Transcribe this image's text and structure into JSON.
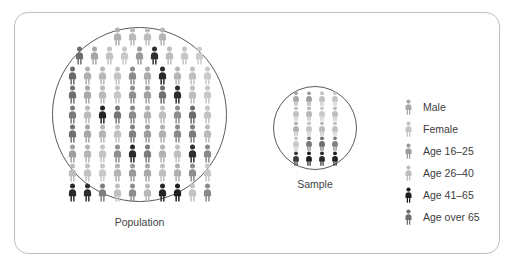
{
  "figure": {
    "type": "pictogram-diagram",
    "frame_border_color": "#bfbfbf",
    "circle_stroke_color": "#5a5a5a",
    "background_color": "#ffffff"
  },
  "population": {
    "caption": "Population",
    "icon_name": "person-icon",
    "columns_max": 10,
    "rows": 9,
    "total_icons": 84,
    "shades": [
      [
        "#b0b0b0",
        "#b8b8b8",
        "#bdbdbd",
        "#b4b4b4"
      ],
      [
        "#6e6e6e",
        "#a5a5a5",
        "#c2c2c2",
        "#c8c8c8",
        "#9a9a9a",
        "#2f2f2f",
        "#bcbcbc",
        "#c6c6c6",
        "#cdcdcd"
      ],
      [
        "#6a6a6a",
        "#b0b0b0",
        "#b8b8b8",
        "#c4c4c4",
        "#8c8c8c",
        "#adadad",
        "#2a2a2a",
        "#b6b6b6",
        "#c0c0c0",
        "#cacaca"
      ],
      [
        "#6f6f6f",
        "#a8a8a8",
        "#bababa",
        "#c6c6c6",
        "#8f8f8f",
        "#a2a2a2",
        "#707070",
        "#2d2d2d",
        "#bdbdbd",
        "#c7c7c7"
      ],
      [
        "#7a7a7a",
        "#bcbcbc",
        "#262626",
        "#767676",
        "#8a8a8a",
        "#b2b2b2",
        "#bebebe",
        "#8e8e8e",
        "#6b6b6b",
        "#c4c4c4"
      ],
      [
        "#707070",
        "#a6a6a6",
        "#b4b4b4",
        "#c2c2c2",
        "#7f7f7f",
        "#9c9c9c",
        "#b0b0b0",
        "#8a8a8a",
        "#7d7d7d",
        "#bababa"
      ],
      [
        "#9e9e9e",
        "#b6b6b6",
        "#c4c4c4",
        "#8e8e8e",
        "#2b2b2b",
        "#7c7c7c",
        "#b2b2b2",
        "#c0c0c0",
        "#2e2e2e",
        "#8a8a8a"
      ],
      [
        "#bcbcbc",
        "#c2c2c2",
        "#c8c8c8",
        "#b4b4b4",
        "#9a9a9a",
        "#a8a8a8",
        "#bebebe",
        "#b0b0b0",
        "#8e8e8e",
        "#c6c6c6"
      ],
      [
        "#2a2a2a",
        "#2d2d2d",
        "#7e7e7e",
        "#c0c0c0",
        "#8c8c8c",
        "#b8b8b8",
        "#252525",
        "#1f1f1f",
        "#c4c4c4",
        "#8a8a8a"
      ]
    ]
  },
  "sample": {
    "caption": "Sample",
    "icon_name": "person-icon",
    "columns_max": 4,
    "rows": 5,
    "total_icons": 20,
    "shades": [
      [
        "#a8a8a8",
        "#9e9e9e",
        "#c0c0c0",
        "#c6c6c6"
      ],
      [
        "#c2c2c2",
        "#b6b6b6",
        "#c8c8c8",
        "#bcbcbc"
      ],
      [
        "#b0b0b0",
        "#c4c4c4",
        "#bababa",
        "#c2c2c2"
      ],
      [
        "#c6c6c6",
        "#787878",
        "#6e6e6e",
        "#808080"
      ],
      [
        "#3a3a3a",
        "#1f1f1f",
        "#2a2a2a",
        "#222222"
      ]
    ]
  },
  "legend": {
    "items": [
      {
        "label": "Male",
        "icon_name": "person-icon-male",
        "color": "#a9a9a9"
      },
      {
        "label": "Female",
        "icon_name": "person-icon-female",
        "color": "#c4c4c4"
      },
      {
        "label": "Age 16–25",
        "icon_name": "person-icon-age-16-25",
        "color": "#9c9c9c"
      },
      {
        "label": "Age 26–40",
        "icon_name": "person-icon-age-26-40",
        "color": "#bdbdbd"
      },
      {
        "label": "Age 41–65",
        "icon_name": "person-icon-age-41-65",
        "color": "#1f1f1f"
      },
      {
        "label": "Age over 65",
        "icon_name": "person-icon-age-over-65",
        "color": "#6e6e6e"
      }
    ]
  }
}
